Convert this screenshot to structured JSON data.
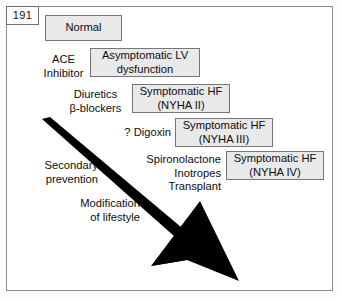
{
  "page": {
    "number": "191"
  },
  "diagram": {
    "box_fill": "#e9e9e9",
    "box_border": "#767676",
    "arrow_color": "#000000",
    "stages": [
      {
        "id": "normal",
        "line1": "Normal",
        "line2": ""
      },
      {
        "id": "asymptomatic-lv-dysfunction",
        "line1": "Asymptomatic LV",
        "line2": "dysfunction"
      },
      {
        "id": "symptomatic-hf-nyha-2",
        "line1": "Symptomatic HF",
        "line2": "(NYHA II)"
      },
      {
        "id": "symptomatic-hf-nyha-3",
        "line1": "Symptomatic HF",
        "line2": "(NYHA III)"
      },
      {
        "id": "symptomatic-hf-nyha-4",
        "line1": "Symptomatic HF",
        "line2": "(NYHA IV)"
      }
    ],
    "treatments": [
      {
        "id": "ace-inhibitor",
        "line1": "ACE",
        "line2": "Inhibitor",
        "line3": ""
      },
      {
        "id": "diuretics-beta-blockers",
        "line1": "Diuretics",
        "line2": "β-blockers",
        "line3": ""
      },
      {
        "id": "digoxin",
        "line1": "? Digoxin",
        "line2": "",
        "line3": ""
      },
      {
        "id": "spironolactone-inotropes-transplant",
        "line1": "Spironolactone",
        "line2": "Inotropes",
        "line3": "Transplant"
      }
    ],
    "side_notes": [
      {
        "id": "secondary-prevention",
        "line1": "Secondary",
        "line2": "prevention"
      },
      {
        "id": "modification-of-lifestyle",
        "line1": "Modification",
        "line2": "of lifestyle"
      }
    ]
  }
}
